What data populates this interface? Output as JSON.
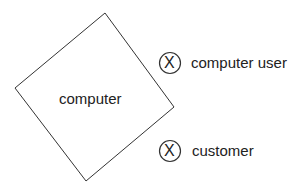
{
  "diagram": {
    "box": {
      "label": "computer"
    },
    "items": [
      {
        "symbol": "X",
        "label": "computer user"
      },
      {
        "symbol": "X",
        "label": "customer"
      }
    ]
  }
}
